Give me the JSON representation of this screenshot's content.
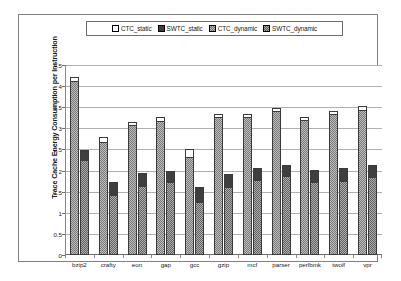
{
  "chart_data": {
    "type": "bar",
    "title": "",
    "xlabel": "",
    "ylabel": "Trace Cache Energy Consumption per Instruction",
    "ylim": [
      0,
      4.5
    ],
    "yticks": [
      "0",
      "0.5",
      "1",
      "1.5",
      "2",
      "2.5",
      "3",
      "3.5",
      "4",
      "4.5"
    ],
    "ytick_values": [
      0,
      0.5,
      1,
      1.5,
      2,
      2.5,
      3,
      3.5,
      4,
      4.5
    ],
    "grid": true,
    "legend_position": "top",
    "legend": [
      "CTC_static",
      "SWTC_static",
      "CTC_dynamic",
      "SWTC_dynamic"
    ],
    "categories": [
      "bzip2",
      "crafty",
      "eon",
      "gap",
      "gcc",
      "gzip",
      "mcf",
      "parser",
      "perlbmk",
      "twolf",
      "vpr"
    ],
    "series": [
      {
        "name": "CTC_dynamic",
        "values": [
          4.13,
          2.68,
          3.07,
          3.18,
          2.32,
          3.27,
          3.26,
          3.42,
          3.19,
          3.33,
          3.44
        ]
      },
      {
        "name": "CTC_static",
        "values": [
          0.08,
          0.12,
          0.09,
          0.1,
          0.19,
          0.08,
          0.08,
          0.07,
          0.09,
          0.08,
          0.08
        ]
      },
      {
        "name": "SWTC_dynamic",
        "values": [
          2.26,
          1.41,
          1.64,
          1.73,
          1.26,
          1.6,
          1.78,
          1.87,
          1.72,
          1.75,
          1.85
        ]
      },
      {
        "name": "SWTC_static",
        "values": [
          0.22,
          0.32,
          0.31,
          0.27,
          0.35,
          0.32,
          0.28,
          0.27,
          0.29,
          0.3,
          0.28
        ]
      }
    ],
    "totals": {
      "CTC": [
        4.21,
        2.8,
        3.16,
        3.28,
        2.51,
        3.35,
        3.34,
        3.49,
        3.28,
        3.41,
        3.52
      ],
      "SWTC": [
        2.48,
        1.73,
        1.95,
        2.0,
        1.61,
        1.92,
        2.06,
        2.14,
        2.01,
        2.05,
        2.13
      ]
    },
    "colors": {
      "ctc_static": "#ffffff",
      "swtc_static": "#3f3f3f",
      "ctc_dynamic": "#bdbdbd",
      "swtc_dynamic": "#aeaeae",
      "grid": "#b0b0b0",
      "axis": "#6e6e6e",
      "border": "#808080",
      "background": "#ffffff"
    }
  }
}
